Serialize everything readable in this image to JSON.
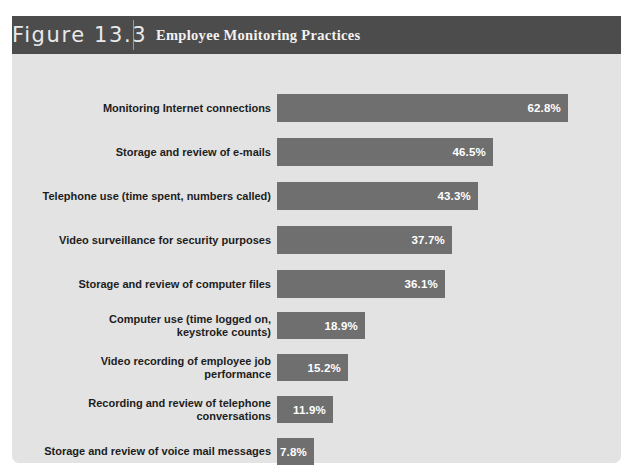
{
  "figure": {
    "number_label": "Figure 13.3",
    "title": "Employee Monitoring Practices"
  },
  "colors": {
    "header_background": "#4c4c4c",
    "panel_background": "#e3e3e3",
    "bar_fill": "#6f6f6f",
    "bar_value_text": "#ffffff",
    "label_text": "#1d1d1d",
    "header_text": "#f2f2f2"
  },
  "chart_data": {
    "type": "bar",
    "orientation": "horizontal",
    "title": "Employee Monitoring Practices",
    "xlabel": "",
    "ylabel": "",
    "xlim": [
      0,
      70
    ],
    "grid": false,
    "legend": "none",
    "value_suffix": "%",
    "categories": [
      "Monitoring Internet connections",
      "Storage and review of e-mails",
      "Telephone use (time spent, numbers called)",
      "Video surveillance for security purposes",
      "Storage and review of computer files",
      "Computer use (time logged on,\nkeystroke counts)",
      "Video recording of employee job\nperformance",
      "Recording and review of telephone\nconversations",
      "Storage and review of voice mail messages"
    ],
    "values": [
      62.8,
      46.5,
      43.3,
      37.7,
      36.1,
      18.9,
      15.2,
      11.9,
      7.8
    ],
    "value_labels": [
      "62.8%",
      "46.5%",
      "43.3%",
      "37.7%",
      "36.1%",
      "18.9%",
      "15.2%",
      "11.9%",
      "7.8%"
    ]
  },
  "bars": [
    {
      "label": "Monitoring Internet connections",
      "value_label": "62.8%",
      "width_px": 291,
      "height_px": 28,
      "top_px": 40
    },
    {
      "label": "Storage and review of e-mails",
      "value_label": "46.5%",
      "width_px": 216,
      "height_px": 28,
      "top_px": 84
    },
    {
      "label": "Telephone use (time spent, numbers called)",
      "value_label": "43.3%",
      "width_px": 201,
      "height_px": 28,
      "top_px": 128
    },
    {
      "label": "Video surveillance for security purposes",
      "value_label": "37.7%",
      "width_px": 175,
      "height_px": 28,
      "top_px": 172
    },
    {
      "label": "Storage and review of computer files",
      "value_label": "36.1%",
      "width_px": 168,
      "height_px": 28,
      "top_px": 216
    },
    {
      "label": "Computer use (time logged on,\nkeystroke counts)",
      "value_label": "18.9%",
      "width_px": 88,
      "height_px": 27,
      "top_px": 258
    },
    {
      "label": "Video recording of employee job\nperformance",
      "value_label": "15.2%",
      "width_px": 71,
      "height_px": 27,
      "top_px": 300
    },
    {
      "label": "Recording and review of telephone\nconversations",
      "value_label": "11.9%",
      "width_px": 56,
      "height_px": 27,
      "top_px": 342
    },
    {
      "label": "Storage and review of voice mail messages",
      "value_label": "7.8%",
      "width_px": 37,
      "height_px": 27,
      "top_px": 384
    }
  ]
}
